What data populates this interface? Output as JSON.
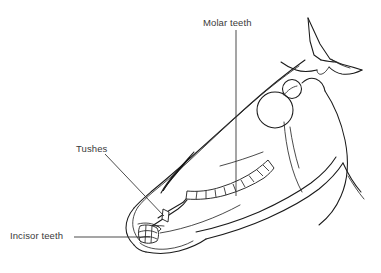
{
  "diagram": {
    "orientation": "facing left",
    "background_color": "#ffffff",
    "line_color": "#1a1a1a",
    "text_color": "#3a3a3a",
    "width": 381,
    "height": 273
  },
  "labels": {
    "molar": {
      "text": "Molar teeth",
      "x": 203,
      "y": 18
    },
    "tushes": {
      "text": "Tushes",
      "x": 76,
      "y": 144
    },
    "incisor": {
      "text": "Incisor teeth",
      "x": 10,
      "y": 231
    }
  },
  "annotations": [
    {
      "name": "molar-leader",
      "label": "Molar teeth",
      "style": "vertical straight line",
      "from": [
        236,
        30
      ],
      "to": [
        236,
        196
      ]
    },
    {
      "name": "tushes-leader",
      "label": "Tushes",
      "style": "diagonal straight line",
      "from": [
        105,
        154
      ],
      "to": [
        164,
        216
      ]
    },
    {
      "name": "incisor-leader",
      "label": "Incisor teeth",
      "style": "horizontal straight line",
      "from": [
        74,
        237
      ],
      "to": [
        150,
        237
      ]
    }
  ],
  "anatomy_parts": [
    "ear",
    "poll",
    "forehead",
    "eye",
    "eye-socket-ridge",
    "nasal-bridge",
    "muzzle",
    "nostril",
    "upper-lip",
    "lower-lip",
    "chin",
    "cheek",
    "jowl",
    "throat",
    "neck-line",
    "mandible"
  ],
  "teeth": {
    "molar_row_segments": 9,
    "incisor_segments": 4,
    "tush_count": 1
  }
}
